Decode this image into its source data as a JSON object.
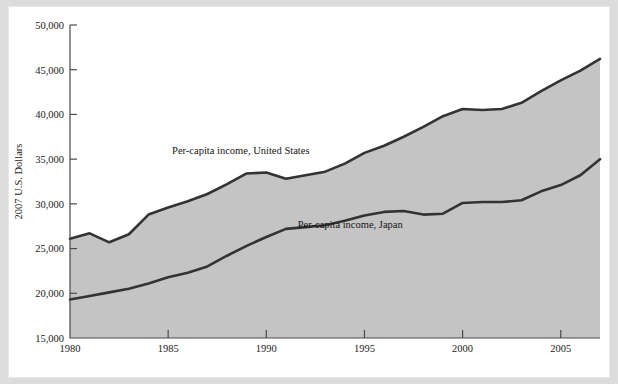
{
  "figure": {
    "background_color": "#dcdcdc",
    "page_color": "#ffffff",
    "band_color": "#c4c4c4",
    "line_color": "#333333"
  },
  "chart_data": {
    "type": "area",
    "title": "",
    "subtitle": "",
    "xlabel": "",
    "ylabel": "2007 U.S. Dollars",
    "xlim": [
      1980,
      2007
    ],
    "ylim": [
      15000,
      50000
    ],
    "grid": false,
    "legend_position": "inline-annotations",
    "x_ticks": [
      "1980",
      "1985",
      "1990",
      "1995",
      "2000",
      "2005"
    ],
    "x_tick_values": [
      1980,
      1985,
      1990,
      1995,
      2000,
      2005
    ],
    "y_ticks": [
      "15,000",
      "20,000",
      "25,000",
      "30,000",
      "35,000",
      "40,000",
      "45,000",
      "50,000"
    ],
    "y_tick_values": [
      15000,
      20000,
      25000,
      30000,
      35000,
      40000,
      45000,
      50000
    ],
    "x": [
      1980,
      1981,
      1982,
      1983,
      1984,
      1985,
      1986,
      1987,
      1988,
      1989,
      1990,
      1991,
      1992,
      1993,
      1994,
      1995,
      1996,
      1997,
      1998,
      1999,
      2000,
      2001,
      2002,
      2003,
      2004,
      2005,
      2006,
      2007
    ],
    "series": [
      {
        "name": "Per-capita income, United States",
        "annotation": "Per-capita income, United States",
        "values": [
          26100,
          26700,
          25700,
          26600,
          28800,
          29600,
          30300,
          31100,
          32200,
          33400,
          33500,
          32800,
          33200,
          33600,
          34500,
          35700,
          36500,
          37500,
          38600,
          39800,
          40600,
          40500,
          40600,
          41300,
          42600,
          43800,
          44900,
          46200
        ]
      },
      {
        "name": "Per-capita income, Japan",
        "annotation": "Per-capita income, Japan",
        "values": [
          19300,
          19700,
          20100,
          20500,
          21100,
          21800,
          22300,
          23000,
          24200,
          25300,
          26300,
          27200,
          27400,
          27600,
          28100,
          28700,
          29100,
          29200,
          28800,
          28900,
          30100,
          30200,
          30200,
          30400,
          31400,
          32100,
          33200,
          35000
        ]
      }
    ],
    "annotations": [
      {
        "text": "Per-capita income, United States",
        "x": 1985.2,
        "y": 35600
      },
      {
        "text": "Per-capita income, Japan",
        "x": 1991.6,
        "y": 27300
      }
    ]
  }
}
